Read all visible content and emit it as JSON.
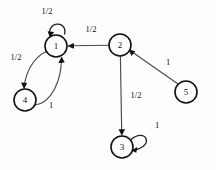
{
  "diagram": {
    "type": "directed-graph",
    "background_color": "#fdfdfd",
    "node_stroke_color": "#111111",
    "edge_color": "#4a4a4a",
    "label_color": "#111111",
    "nodes": [
      {
        "id": "1",
        "label": "1",
        "cx": 56,
        "cy": 46,
        "r": 11
      },
      {
        "id": "2",
        "label": "2",
        "cx": 120,
        "cy": 45,
        "r": 11
      },
      {
        "id": "3",
        "label": "3",
        "cx": 122,
        "cy": 147,
        "r": 11
      },
      {
        "id": "4",
        "label": "4",
        "cx": 25,
        "cy": 100,
        "r": 11
      },
      {
        "id": "5",
        "label": "5",
        "cx": 186,
        "cy": 92,
        "r": 11
      }
    ],
    "edges": [
      {
        "id": "e1",
        "from": "1",
        "to": "1",
        "label": "1/2",
        "kind": "self-loop-top",
        "label_x": 47,
        "label_y": 11
      },
      {
        "id": "e2",
        "from": "2",
        "to": "1",
        "label": "1/2",
        "kind": "straight",
        "label_x": 91,
        "label_y": 29
      },
      {
        "id": "e3",
        "from": "1",
        "to": "4",
        "label": "1/2",
        "kind": "curve-left",
        "label_x": 16,
        "label_y": 57
      },
      {
        "id": "e4",
        "from": "4",
        "to": "1",
        "label": "1",
        "kind": "curve-right",
        "label_x": 51,
        "label_y": 105
      },
      {
        "id": "e5",
        "from": "2",
        "to": "3",
        "label": "1/2",
        "kind": "straight",
        "label_x": 136,
        "label_y": 95
      },
      {
        "id": "e6",
        "from": "5",
        "to": "2",
        "label": "1",
        "kind": "straight",
        "label_x": 168,
        "label_y": 62
      },
      {
        "id": "e7",
        "from": "3",
        "to": "3",
        "label": "1",
        "kind": "self-loop-right",
        "label_x": 157,
        "label_y": 125
      }
    ]
  }
}
